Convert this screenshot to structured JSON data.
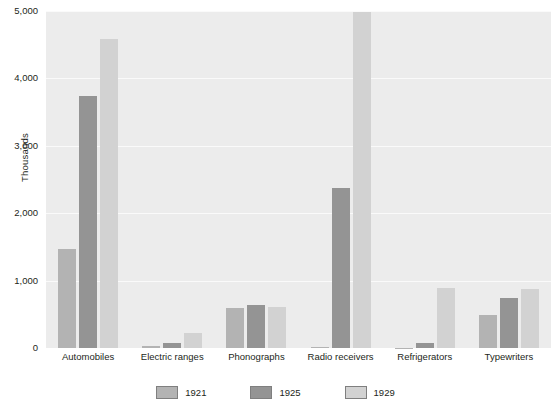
{
  "chart_data": {
    "type": "bar",
    "title": "",
    "subtitle": "",
    "xlabel": "",
    "ylabel": "Thousands",
    "ylim": [
      0,
      5000
    ],
    "yticks": [
      0,
      1000,
      2000,
      3000,
      4000,
      5000
    ],
    "ytick_labels": [
      "0",
      "1,000",
      "2,000",
      "3,000",
      "4,000",
      "5,000"
    ],
    "grid": true,
    "grid_axis": "y",
    "legend_position": "bottom",
    "categories": [
      "Automobiles",
      "Electric ranges",
      "Phonographs",
      "Radio receivers",
      "Refrigerators",
      "Typewriters"
    ],
    "series": [
      {
        "name": "1921",
        "color": "#b3b3b3",
        "values": [
          1468,
          30,
          596,
          12,
          5,
          488
        ]
      },
      {
        "name": "1925",
        "color": "#949494",
        "values": [
          3735,
          75,
          643,
          2374,
          75,
          742
        ]
      },
      {
        "name": "1929",
        "color": "#d2d2d2",
        "values": [
          4587,
          220,
          606,
          4988,
          890,
          883
        ]
      }
    ],
    "plot_background": "#ececec",
    "gridline_color": "#fafafa",
    "page_background": "#ffffff"
  },
  "legend": {
    "items": [
      {
        "label": "1921",
        "color": "#b3b3b3"
      },
      {
        "label": "1925",
        "color": "#949494"
      },
      {
        "label": "1929",
        "color": "#d2d2d2"
      }
    ]
  }
}
